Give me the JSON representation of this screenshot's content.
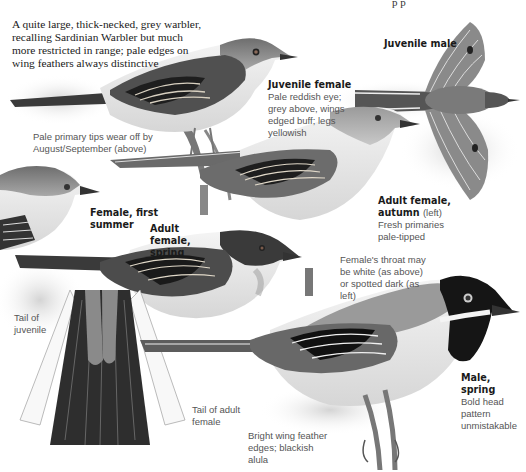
{
  "page": {
    "cut_off_top_text": "p p",
    "intro": "A quite large, thick-necked, grey warbler, recalling Sardinian Warbler but much more restricted in range; pale edges on wing feathers always distinctive"
  },
  "annotations": {
    "juvenile_male": {
      "title": "Juvenile male"
    },
    "juvenile_female": {
      "title": "Juvenile female",
      "note": "Pale reddish eye; grey above, wings edged buff; legs yellowish"
    },
    "pale_primary": {
      "note": "Pale primary tips wear off by August/September (above)"
    },
    "female_first_summer": {
      "title": "Female, first summer"
    },
    "adult_female_spring": {
      "title": "Adult female, spring"
    },
    "adult_female_autumn": {
      "title": "Adult female, autumn",
      "title_suffix": "(left)",
      "note": "Fresh primaries pale-tipped"
    },
    "female_throat": {
      "note": "Female's throat may be white (as above) or spotted dark (as left)"
    },
    "tail_juvenile": {
      "note": "Tail of juvenile"
    },
    "tail_adult_female": {
      "note": "Tail of adult female"
    },
    "wing_edges": {
      "note": "Bright wing feather edges; blackish alula"
    },
    "male_spring": {
      "title": "Male, spring",
      "note": "Bold head pattern unmistakable"
    }
  },
  "colors": {
    "background": "#ffffff",
    "bird_grey": "#8a8a8a",
    "bird_dark": "#2a2a2a",
    "bird_pale": "#e8e8e8",
    "text_dark": "#1a1a1a",
    "text_note": "#555555"
  }
}
